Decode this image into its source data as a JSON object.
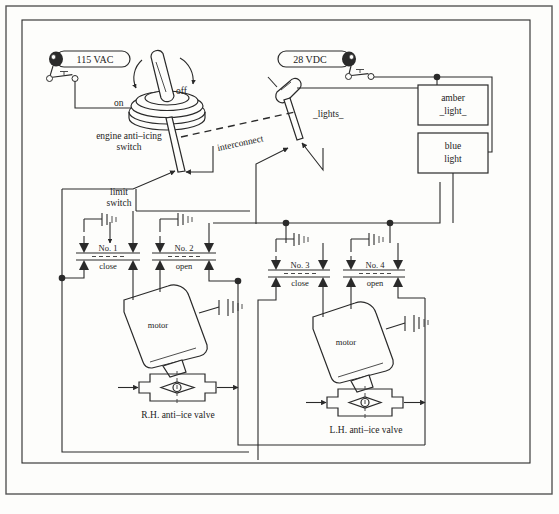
{
  "diagram": {
    "type": "electrical-schematic",
    "background_color": "#fdfdfb",
    "line_color": "#2a2a2a"
  },
  "power_sources": [
    {
      "id": "ac",
      "label": "115 VAC",
      "shape": "pill-bus-bar"
    },
    {
      "id": "dc",
      "label": "28 VDC",
      "shape": "pill-bus-bar"
    }
  ],
  "switches": {
    "engine_anti_icing": {
      "label_line1": "engine anti–icing",
      "label_line2": "switch",
      "position_on": "on",
      "position_off": "off"
    },
    "lights_switch": {
      "label": "_lights_"
    },
    "limit_switch": {
      "label_line1": "limit",
      "label_line2": "switch"
    },
    "interconnect": {
      "label": "interconnect"
    }
  },
  "relays": [
    {
      "id": "no1",
      "number": "No. 1",
      "action": "close"
    },
    {
      "id": "no2",
      "number": "No. 2",
      "action": "open"
    },
    {
      "id": "no3",
      "number": "No. 3",
      "action": "close"
    },
    {
      "id": "no4",
      "number": "No. 4",
      "action": "open"
    }
  ],
  "indicator_lights": [
    {
      "id": "amber",
      "line1": "amber",
      "line2": "_light_"
    },
    {
      "id": "blue",
      "line1": "blue",
      "line2": "light"
    }
  ],
  "actuators": [
    {
      "id": "rh",
      "motor_label": "motor",
      "valve_label": "R.H. anti–ice valve"
    },
    {
      "id": "lh",
      "motor_label": "motor",
      "valve_label": "L.H. anti–ice valve"
    }
  ]
}
